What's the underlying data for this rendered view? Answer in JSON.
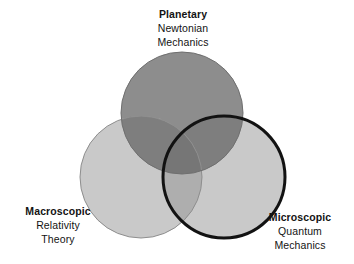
{
  "diagram": {
    "kind": "venn-diagram-3-set",
    "background_color": "#ffffff",
    "sets": [
      {
        "id": "planetary",
        "title": "Planetary",
        "line2": "Newtonian",
        "line3": "Mechanics",
        "fill_color": "#8d8d8d",
        "stroke_color": "#6f6f6f",
        "stroke_width": 1,
        "emphasis": "false",
        "center_x": 182,
        "center_y": 113,
        "radius": 61,
        "position": "top"
      },
      {
        "id": "macroscopic",
        "title": "Macroscopic",
        "line2": "Relativity",
        "line3": "Theory",
        "fill_color": "#c9c9c9",
        "stroke_color": "#8e8e8e",
        "stroke_width": 1,
        "emphasis": "false",
        "center_x": 141,
        "center_y": 177,
        "radius": 61,
        "position": "bottom-left"
      },
      {
        "id": "microscopic",
        "title": "Microscopic",
        "line2": "Quantum",
        "line3": "Mechanics",
        "fill_color": "#c9c9c9",
        "stroke_color": "#121212",
        "stroke_width": 3,
        "emphasis": "true",
        "center_x": 224,
        "center_y": 177,
        "radius": 61,
        "position": "bottom-right"
      }
    ],
    "overlap_colors": {
      "planetary_macroscopic": "#7e7e7e",
      "planetary_microscopic": "#7e7e7e",
      "macroscopic_microscopic": "#aeaeae",
      "all_three": "#767676"
    },
    "text_color": "#131313"
  }
}
